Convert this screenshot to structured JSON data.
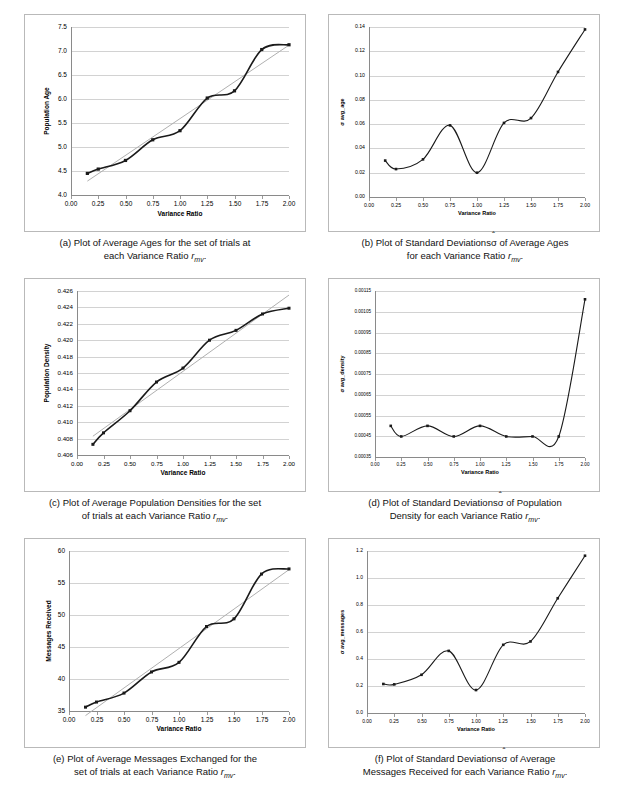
{
  "figure": {
    "panels": [
      "a",
      "b",
      "c",
      "d",
      "e",
      "f"
    ],
    "shared_xlabel": "Variance Ratio",
    "shared_xticks": [
      "0.00",
      "0.25",
      "0.50",
      "0.75",
      "1.00",
      "1.25",
      "1.50",
      "1.75",
      "2.00"
    ]
  },
  "captions": {
    "a_line1": "(a) Plot of Average Ages for the set of trials at",
    "a_line2_pre": "each Variance Ratio ",
    "a_line2_var": "r",
    "a_line2_sub": "mv",
    "a_line2_post": ".",
    "b_line1_pre": "(b) Plot of Standard Deviations",
    "b_line1_sig": "σ",
    "b_line1_post": " of Average Ages",
    "b_line2_pre": "for each Variance Ratio ",
    "b_line2_var": "r",
    "b_line2_sub": "mv",
    "b_line2_post": ".",
    "c_line1": "(c) Plot of Average Population Densities for the set",
    "c_line2_pre": "of trials at each Variance Ratio ",
    "c_line2_var": "r",
    "c_line2_sub": "mv",
    "c_line2_post": ".",
    "d_line1_pre": "(d) Plot of Standard Deviations",
    "d_line1_sig": "σ",
    "d_line1_post": " of Population",
    "d_line2_pre": "Density for each Variance Ratio ",
    "d_line2_var": "r",
    "d_line2_sub": "mv",
    "d_line2_post": ".",
    "e_line1": "(e) Plot of Average Messages Exchanged for the",
    "e_line2_pre": "set of trials at each Variance Ratio ",
    "e_line2_var": "r",
    "e_line2_sub": "mv",
    "e_line2_post": ".",
    "f_line1_pre": "(f) Plot of Standard Deviations",
    "f_line1_sig": "σ",
    "f_line1_post": " of Average",
    "f_line2_pre": "Messages Received for each Variance Ratio ",
    "f_line2_var": "r",
    "f_line2_sub": "mv",
    "f_line2_post": "."
  },
  "chart_data": [
    {
      "id": "a",
      "type": "line",
      "title": "",
      "xlabel": "Variance Ratio",
      "ylabel": "Population Age",
      "x": [
        0.15,
        0.25,
        0.5,
        0.75,
        1.0,
        1.25,
        1.5,
        1.75,
        2.0
      ],
      "values": [
        4.45,
        4.54,
        4.72,
        5.15,
        5.34,
        6.02,
        6.17,
        7.03,
        7.13
      ],
      "xticks": [
        "0.00",
        "0.25",
        "0.50",
        "0.75",
        "1.00",
        "1.25",
        "1.50",
        "1.75",
        "2.00"
      ],
      "yticks": [
        "4.0",
        "4.5",
        "5.0",
        "5.5",
        "6.0",
        "6.5",
        "7.0",
        "7.5"
      ],
      "xlim": [
        0.0,
        2.0
      ],
      "ylim": [
        4.0,
        7.5
      ],
      "grid": true,
      "smooth": true,
      "trendline": true,
      "markers": true,
      "legend": "none"
    },
    {
      "id": "b",
      "type": "line",
      "title": "",
      "xlabel": "Variance Ratio",
      "ylabel": "σ avg_age",
      "x": [
        0.15,
        0.25,
        0.5,
        0.75,
        1.0,
        1.25,
        1.5,
        1.75,
        2.0
      ],
      "values": [
        0.03,
        0.023,
        0.031,
        0.059,
        0.02,
        0.061,
        0.065,
        0.103,
        0.138
      ],
      "xticks": [
        "0.00",
        "0.25",
        "0.50",
        "0.75",
        "1.00",
        "1.25",
        "1.50",
        "1.75",
        "2.00"
      ],
      "yticks": [
        "0.00",
        "0.02",
        "0.04",
        "0.06",
        "0.08",
        "0.10",
        "0.12",
        "0.14"
      ],
      "xlim": [
        0.0,
        2.0
      ],
      "ylim": [
        0.0,
        0.14
      ],
      "grid": true,
      "smooth": true,
      "trendline": false,
      "markers": true,
      "legend": "none"
    },
    {
      "id": "c",
      "type": "line",
      "title": "",
      "xlabel": "Variance Ratio",
      "ylabel": "Population Density",
      "x": [
        0.15,
        0.25,
        0.5,
        0.75,
        1.0,
        1.25,
        1.5,
        1.75,
        2.0
      ],
      "values": [
        0.4073,
        0.4087,
        0.4114,
        0.4149,
        0.4166,
        0.42,
        0.4212,
        0.4232,
        0.4239
      ],
      "xticks": [
        "0.00",
        "0.25",
        "0.50",
        "0.75",
        "1.00",
        "1.25",
        "1.50",
        "1.75",
        "2.00"
      ],
      "yticks": [
        "0.406",
        "0.408",
        "0.410",
        "0.412",
        "0.414",
        "0.416",
        "0.418",
        "0.420",
        "0.422",
        "0.424",
        "0.426"
      ],
      "xlim": [
        0.0,
        2.0
      ],
      "ylim": [
        0.406,
        0.426
      ],
      "grid": true,
      "smooth": true,
      "trendline": true,
      "markers": true,
      "legend": "none"
    },
    {
      "id": "d",
      "type": "line",
      "title": "",
      "xlabel": "Variance Ratio",
      "ylabel": "σ avg_density",
      "x": [
        0.15,
        0.25,
        0.5,
        0.75,
        1.0,
        1.25,
        1.5,
        1.75,
        2.0
      ],
      "values": [
        0.0005,
        0.000449,
        0.0005,
        0.000449,
        0.0005,
        0.000449,
        0.000449,
        0.000449,
        0.00111
      ],
      "xticks": [
        "0.00",
        "0.25",
        "0.50",
        "0.75",
        "1.00",
        "1.25",
        "1.50",
        "1.75",
        "2.00"
      ],
      "yticks": [
        "0.00035",
        "0.00045",
        "0.00055",
        "0.00065",
        "0.00075",
        "0.00085",
        "0.00095",
        "0.00105",
        "0.00115"
      ],
      "xlim": [
        0.0,
        2.0
      ],
      "ylim": [
        0.00035,
        0.00115
      ],
      "grid": true,
      "smooth": true,
      "trendline": false,
      "markers": true,
      "legend": "none"
    },
    {
      "id": "e",
      "type": "line",
      "title": "",
      "xlabel": "Variance Ratio",
      "ylabel": "Messages Received",
      "x": [
        0.15,
        0.25,
        0.5,
        0.75,
        1.0,
        1.25,
        1.5,
        1.75,
        2.0
      ],
      "values": [
        35.6,
        36.4,
        37.8,
        41.1,
        42.6,
        48.2,
        49.4,
        56.4,
        57.2
      ],
      "xticks": [
        "0.00",
        "0.25",
        "0.50",
        "0.75",
        "1.00",
        "1.25",
        "1.50",
        "1.75",
        "2.00"
      ],
      "yticks": [
        "35",
        "40",
        "45",
        "50",
        "55",
        "60"
      ],
      "xlim": [
        0.0,
        2.0
      ],
      "ylim": [
        35,
        60
      ],
      "grid": true,
      "smooth": true,
      "trendline": true,
      "markers": true,
      "legend": "none"
    },
    {
      "id": "f",
      "type": "line",
      "title": "",
      "xlabel": "Variance Ratio",
      "ylabel": "σ avg_messages",
      "x": [
        0.15,
        0.25,
        0.5,
        0.75,
        1.0,
        1.25,
        1.5,
        1.75,
        2.0
      ],
      "values": [
        0.215,
        0.212,
        0.283,
        0.46,
        0.17,
        0.505,
        0.53,
        0.85,
        1.165
      ],
      "xticks": [
        "0.00",
        "0.25",
        "0.50",
        "0.75",
        "1.00",
        "1.25",
        "1.50",
        "1.75",
        "2.00"
      ],
      "yticks": [
        "0.0",
        "0.2",
        "0.4",
        "0.6",
        "0.8",
        "1.0",
        "1.2"
      ],
      "xlim": [
        0.0,
        2.0
      ],
      "ylim": [
        0.0,
        1.2
      ],
      "grid": true,
      "smooth": true,
      "trendline": false,
      "markers": true,
      "legend": "none"
    }
  ],
  "colors": {
    "series": "#1a1a1a",
    "trendline": "#b0b0b0",
    "grid": "#d2d2d2",
    "axis": "#8a8a8a",
    "frame": "#b9b9b9",
    "text": "#000000"
  }
}
